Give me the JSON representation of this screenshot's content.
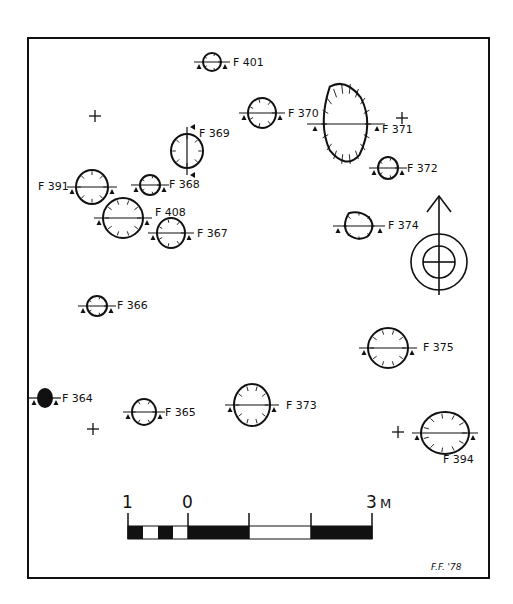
{
  "figure": {
    "type": "archaeological site plan",
    "frame": {
      "x": 28,
      "y": 38,
      "w": 461,
      "h": 540
    },
    "colors": {
      "ink": "#111111",
      "paper": "#ffffff"
    },
    "signature": "F.F. '78"
  },
  "features": [
    {
      "id": "F 401",
      "cx": 212,
      "cy": 62,
      "rx": 9,
      "ry": 9,
      "label_x": 233,
      "label_y": 66,
      "section": "horizontal",
      "fill": "none"
    },
    {
      "id": "F 370",
      "cx": 262,
      "cy": 113,
      "rx": 14,
      "ry": 15,
      "label_x": 288,
      "label_y": 117,
      "section": "horizontal",
      "fill": "none"
    },
    {
      "id": "F 371",
      "cx": 346,
      "cy": 124,
      "rx": 27,
      "ry": 44,
      "label_x": 382,
      "label_y": 133,
      "section": "horizontal",
      "fill": "none",
      "shape": "irregular"
    },
    {
      "id": "F 369",
      "cx": 187,
      "cy": 151,
      "rx": 16,
      "ry": 17,
      "label_x": 199,
      "label_y": 137,
      "section": "vertical",
      "fill": "none"
    },
    {
      "id": "F 372",
      "cx": 388,
      "cy": 168,
      "rx": 10,
      "ry": 11,
      "label_x": 407,
      "label_y": 172,
      "section": "horizontal",
      "fill": "none"
    },
    {
      "id": "F 391",
      "cx": 92,
      "cy": 187,
      "rx": 16,
      "ry": 17,
      "label_x": 38,
      "label_y": 190,
      "section": "horizontal",
      "fill": "none"
    },
    {
      "id": "F 368",
      "cx": 150,
      "cy": 185,
      "rx": 10,
      "ry": 10,
      "label_x": 169,
      "label_y": 188,
      "section": "horizontal",
      "fill": "none"
    },
    {
      "id": "F 408",
      "cx": 123,
      "cy": 218,
      "rx": 20,
      "ry": 20,
      "label_x": 155,
      "label_y": 216,
      "section": "horizontal",
      "fill": "none"
    },
    {
      "id": "F 367",
      "cx": 171,
      "cy": 233,
      "rx": 14,
      "ry": 15,
      "label_x": 197,
      "label_y": 237,
      "section": "horizontal",
      "fill": "none"
    },
    {
      "id": "F 374",
      "cx": 359,
      "cy": 226,
      "rx": 17,
      "ry": 15,
      "label_x": 388,
      "label_y": 229,
      "section": "horizontal",
      "fill": "none",
      "shape": "irregular"
    },
    {
      "id": "F 366",
      "cx": 97,
      "cy": 306,
      "rx": 10,
      "ry": 10,
      "label_x": 117,
      "label_y": 309,
      "section": "horizontal",
      "fill": "none"
    },
    {
      "id": "F 375",
      "cx": 388,
      "cy": 348,
      "rx": 20,
      "ry": 20,
      "label_x": 423,
      "label_y": 351,
      "section": "horizontal",
      "fill": "none"
    },
    {
      "id": "F 364",
      "cx": 45,
      "cy": 398,
      "rx": 7,
      "ry": 9,
      "label_x": 62,
      "label_y": 402,
      "section": "horizontal",
      "fill": "solid"
    },
    {
      "id": "F 365",
      "cx": 144,
      "cy": 412,
      "rx": 12,
      "ry": 13,
      "label_x": 165,
      "label_y": 416,
      "section": "horizontal",
      "fill": "none"
    },
    {
      "id": "F 373",
      "cx": 252,
      "cy": 405,
      "rx": 18,
      "ry": 21,
      "label_x": 286,
      "label_y": 409,
      "section": "horizontal",
      "fill": "none"
    },
    {
      "id": "F 394",
      "cx": 445,
      "cy": 433,
      "rx": 24,
      "ry": 21,
      "label_x": 443,
      "label_y": 463,
      "section": "horizontal",
      "fill": "none"
    }
  ],
  "grid_marks": [
    {
      "x": 95,
      "y": 116
    },
    {
      "x": 402,
      "y": 118
    },
    {
      "x": 93,
      "y": 429
    },
    {
      "x": 398,
      "y": 432
    }
  ],
  "north_arrow": {
    "x": 439,
    "y": 262,
    "label": "north-arrow"
  },
  "scale_bar": {
    "labels": [
      {
        "text": "1",
        "x": 128
      },
      {
        "text": "0",
        "x": 188
      },
      {
        "text": "3",
        "x": 372
      },
      {
        "text": "M",
        "x": 386
      }
    ],
    "unit": "M",
    "x0": 128,
    "x_zero": 188,
    "x_end": 372,
    "y": 526
  }
}
